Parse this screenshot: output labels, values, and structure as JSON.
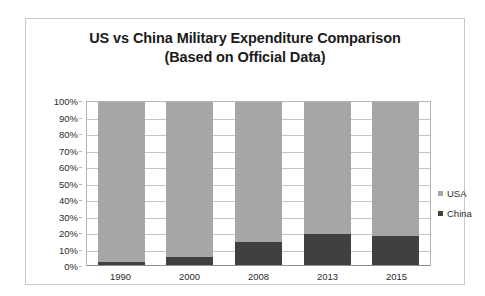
{
  "chart_data": {
    "type": "bar",
    "subtype": "100% stacked column",
    "title": "US vs China Military Expenditure Comparison",
    "subtitle": "(Based on Official Data)",
    "xlabel": "",
    "ylabel": "",
    "ylim": [
      0,
      100
    ],
    "y_tick_labels": [
      "100%",
      "90%",
      "80%",
      "70%",
      "60%",
      "50%",
      "40%",
      "30%",
      "20%",
      "10%",
      "0%"
    ],
    "y_tick_values": [
      100,
      90,
      80,
      70,
      60,
      50,
      40,
      30,
      20,
      10,
      0
    ],
    "grid": true,
    "legend_position": "right",
    "categories": [
      "1990",
      "2000",
      "2008",
      "2013",
      "2015"
    ],
    "series": [
      {
        "name": "USA",
        "color": "#a6a6a6",
        "values": [
          98,
          95,
          86,
          81,
          82
        ]
      },
      {
        "name": "China",
        "color": "#404040",
        "values": [
          2,
          5,
          14,
          19,
          18
        ]
      }
    ]
  },
  "legend": {
    "items": [
      {
        "label": "USA",
        "color": "#a6a6a6"
      },
      {
        "label": "China",
        "color": "#404040"
      }
    ]
  },
  "colors": {
    "usa": "#a6a6a6",
    "china": "#404040",
    "gridline": "#c5c5c5",
    "axis": "#8d8d8d",
    "frame_border": "#c9c9c9",
    "text": "#2b2b2b",
    "title_text": "#1a1a1a",
    "background": "#ffffff"
  }
}
